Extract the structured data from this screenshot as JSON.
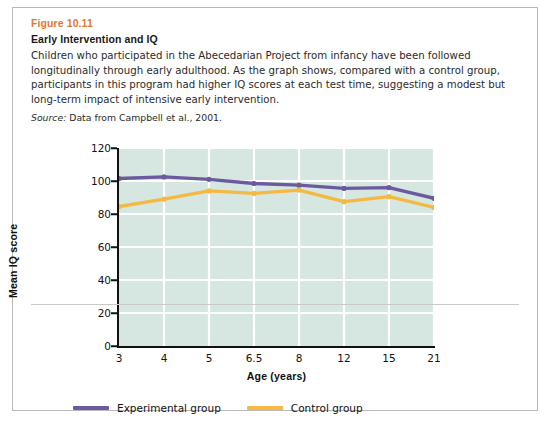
{
  "figure": {
    "number": "Figure 10.11",
    "title": "Early Intervention and IQ",
    "caption": "Children who participated in the Abecedarian Project from infancy have been followed longitudinally through early adulthood. As the graph shows, compared with a control group, participants in this program had higher IQ scores at each test time, suggesting a modest but long-term impact of intensive early intervention.",
    "source_label": "Source:",
    "source_text": "Data from Campbell et al., 2001."
  },
  "colors": {
    "experimental": "#6B5B9E",
    "control": "#F5B942",
    "plot_background": "#D6E7E2",
    "gridline": "#FFFFFF",
    "figure_number": "#E07A2F",
    "axis": "#111111"
  },
  "chart_data": {
    "type": "line",
    "title": "Early Intervention and IQ",
    "xlabel": "Age (years)",
    "ylabel": "Mean IQ score",
    "categories": [
      "3",
      "4",
      "5",
      "6.5",
      "8",
      "12",
      "15",
      "21"
    ],
    "ylim": [
      0,
      120
    ],
    "yticks": [
      0,
      20,
      40,
      60,
      80,
      100,
      120
    ],
    "grid": true,
    "legend_position": "bottom",
    "series": [
      {
        "name": "Experimental group",
        "color": "#6B5B9E",
        "values": [
          101.5,
          102.5,
          101,
          98.5,
          97.5,
          95.5,
          96,
          89.5
        ]
      },
      {
        "name": "Control group",
        "color": "#F5B942",
        "values": [
          84.5,
          89,
          94,
          92.5,
          94.5,
          87.5,
          90.5,
          84
        ]
      }
    ]
  }
}
